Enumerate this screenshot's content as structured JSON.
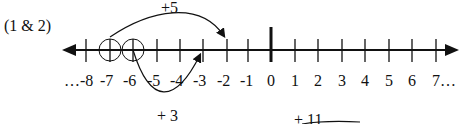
{
  "problem_label": "(1 & 2)",
  "number_line": {
    "min_shown": -8,
    "max_shown": 7,
    "tick_labels": [
      "…-8",
      "-7",
      "-6",
      "-5",
      "-4",
      "-3",
      "-2",
      "-1",
      "0",
      "1",
      "2",
      "3",
      "4",
      "5",
      "6",
      "7…"
    ],
    "circled_points": [
      -7,
      -6
    ],
    "emphasized_tick": 0
  },
  "jumps": [
    {
      "label": "+5",
      "from": -7,
      "to": -2,
      "side": "above"
    },
    {
      "label": "+ 3",
      "from": -6,
      "to": -3,
      "side": "below"
    },
    {
      "label": "+ 11",
      "from": 0,
      "to": 11,
      "side": "below"
    }
  ]
}
